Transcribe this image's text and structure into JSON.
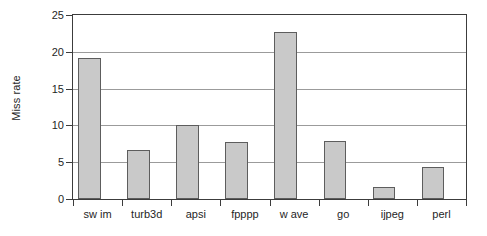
{
  "chart_data": {
    "type": "bar",
    "title": "",
    "xlabel": "",
    "ylabel": "Miss rate",
    "ylim": [
      0,
      25
    ],
    "ytick_labels": [
      "0",
      "5",
      "10",
      "15",
      "20",
      "25"
    ],
    "yticks": [
      0,
      5,
      10,
      15,
      20,
      25
    ],
    "grid": true,
    "legend": "none",
    "categories": [
      "sw im",
      "turb3d",
      "apsi",
      "fpppp",
      "w ave",
      "go",
      "ijpeg",
      "perl"
    ],
    "values": [
      19.1,
      6.6,
      10.1,
      7.7,
      22.7,
      7.9,
      1.6,
      4.3
    ],
    "series": [
      {
        "name": "Miss rate",
        "values": [
          19.1,
          6.6,
          10.1,
          7.7,
          22.7,
          7.9,
          1.6,
          4.3
        ]
      }
    ],
    "colors": {
      "bar_fill": "#c9c9c9",
      "bar_border": "#5d5d5d",
      "gridline": "#9b9b9b",
      "frame": "#3c3c3c",
      "background": "#ffffff",
      "text": "#1f1f1f"
    }
  }
}
